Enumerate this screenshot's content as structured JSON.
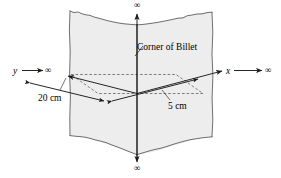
{
  "figure": {
    "name": "corner-of-billet-semi-infinite-solid-diagram",
    "background_color": "#ffffff",
    "line_color": "#1a1a1a",
    "billet_fill_color": "#ededed",
    "billet_edge_color": "#555555"
  },
  "annotations": {
    "corner_label": "Corner of Billet",
    "dimension_20cm": "20 cm",
    "dimension_5cm": "5 cm"
  },
  "axes": {
    "x_label": "x",
    "y_label": "y",
    "x_infinity": "∞",
    "y_infinity": "∞",
    "vertical_top_infinity": "∞",
    "vertical_bottom_infinity": "∞"
  }
}
